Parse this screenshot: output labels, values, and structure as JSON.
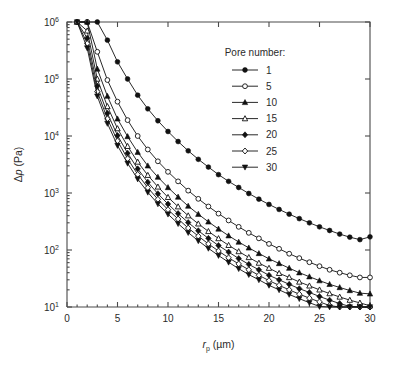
{
  "chart_data": {
    "type": "line",
    "title": "",
    "xlabel": "r_p (µm)",
    "ylabel": "Δp (Pa)",
    "xlabel_parts": {
      "italic": "r",
      "sub": "p",
      "unit": "(µm)"
    },
    "ylabel_parts": {
      "delta": "Δ",
      "italic": "p",
      "unit": "(Pa)"
    },
    "xlim": [
      0,
      30
    ],
    "ylim": [
      10,
      1000000
    ],
    "yscale": "log",
    "xscale": "linear",
    "grid": false,
    "xticks": [
      0,
      5,
      10,
      15,
      20,
      25,
      30
    ],
    "xticklabels": [
      "0",
      "5",
      "10",
      "15",
      "20",
      "25",
      "30"
    ],
    "yticks": [
      10,
      100,
      1000,
      10000,
      100000,
      1000000
    ],
    "yticklabels": [
      "10¹",
      "10²",
      "10³",
      "10⁴",
      "10⁵",
      "10⁶"
    ],
    "ytick_mantissa": [
      "10",
      "10",
      "10",
      "10",
      "10",
      "10"
    ],
    "ytick_exponents": [
      "1",
      "2",
      "3",
      "4",
      "5",
      "6"
    ],
    "legend": {
      "title": "Pore number:",
      "position": "upper-right-inside",
      "entries": [
        {
          "name": "1",
          "marker": "circle-filled",
          "color": "#111111"
        },
        {
          "name": "5",
          "marker": "circle-open",
          "color": "#111111"
        },
        {
          "name": "10",
          "marker": "triangle-up-filled",
          "color": "#111111"
        },
        {
          "name": "15",
          "marker": "triangle-up-open",
          "color": "#111111"
        },
        {
          "name": "20",
          "marker": "diamond-filled",
          "color": "#111111"
        },
        {
          "name": "25",
          "marker": "diamond-open",
          "color": "#111111"
        },
        {
          "name": "30",
          "marker": "triangle-down-filled",
          "color": "#111111"
        }
      ]
    },
    "x": [
      1,
      2,
      3,
      4,
      5,
      6,
      7,
      8,
      9,
      10,
      11,
      12,
      13,
      14,
      15,
      16,
      17,
      18,
      19,
      20,
      21,
      22,
      23,
      24,
      25,
      26,
      27,
      28,
      29,
      30
    ],
    "series": [
      {
        "name": "1",
        "marker": "circle-filled",
        "values": [
          1000000,
          1000000,
          1000000,
          480000,
          200000,
          100000,
          52000,
          30000,
          18500,
          12000,
          8000,
          5500,
          3900,
          2850,
          2100,
          1600,
          1250,
          980,
          780,
          630,
          515,
          425,
          355,
          300,
          255,
          220,
          190,
          168,
          152,
          170
        ]
      },
      {
        "name": "5",
        "marker": "circle-open",
        "values": [
          1000000,
          1000000,
          300000,
          96000,
          40000,
          19000,
          10000,
          5800,
          3600,
          2350,
          1600,
          1100,
          790,
          580,
          435,
          330,
          255,
          200,
          160,
          128,
          105,
          86,
          72,
          61,
          52,
          45,
          40,
          36,
          33,
          33
        ]
      },
      {
        "name": "10",
        "marker": "triangle-up-filled",
        "values": [
          1000000,
          1000000,
          150000,
          50000,
          20000,
          9800,
          5200,
          3000,
          1900,
          1250,
          850,
          590,
          425,
          312,
          234,
          178,
          138,
          109,
          87,
          70,
          58,
          48,
          40,
          34,
          29,
          25,
          22,
          19.5,
          17.5,
          17
        ]
      },
      {
        "name": "15",
        "marker": "triangle-up-open",
        "values": [
          1000000,
          700000,
          100000,
          33000,
          13500,
          6600,
          3500,
          2050,
          1280,
          840,
          575,
          400,
          288,
          212,
          159,
          121,
          94,
          74,
          59,
          48,
          39,
          33,
          27.5,
          23.5,
          20,
          17.2,
          15,
          13.2,
          11.8,
          10.5
        ]
      },
      {
        "name": "20",
        "marker": "diamond-filled",
        "values": [
          1000000,
          520000,
          75000,
          25000,
          10200,
          5000,
          2650,
          1550,
          970,
          640,
          435,
          303,
          218,
          160,
          120,
          92,
          71,
          56,
          45,
          36,
          30,
          25,
          21,
          18,
          15.3,
          13.2,
          11.5,
          10.2,
          10,
          10
        ]
      },
      {
        "name": "25",
        "marker": "diamond-open",
        "values": [
          1000000,
          420000,
          60000,
          20000,
          8200,
          4000,
          2120,
          1240,
          775,
          510,
          350,
          243,
          175,
          128,
          96,
          73,
          57,
          45,
          36,
          29,
          24,
          20,
          16.8,
          14.3,
          12.3,
          10.6,
          10,
          10,
          10,
          10
        ]
      },
      {
        "name": "30",
        "marker": "triangle-down-filled",
        "values": [
          1000000,
          350000,
          50000,
          16600,
          6800,
          3320,
          1760,
          1030,
          645,
          425,
          290,
          202,
          145,
          107,
          80,
          61,
          47,
          37,
          30,
          24,
          20,
          16.6,
          14,
          11.9,
          10.2,
          10,
          10,
          10,
          10,
          10
        ]
      }
    ]
  },
  "figure": {
    "plot_area": {
      "left": 67,
      "top": 22,
      "right": 370,
      "bottom": 307
    },
    "background": "#ffffff",
    "axis_color": "#4a4a4a",
    "line_color": "#111111"
  }
}
